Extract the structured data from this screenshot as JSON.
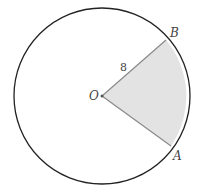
{
  "diagram": {
    "type": "circle-sector",
    "center_label": "O",
    "point_b_label": "B",
    "point_a_label": "A",
    "radius_label": "8",
    "colors": {
      "circle_stroke": "#222222",
      "radius_stroke": "#8a8a8a",
      "sector_fill": "#e3e3e3",
      "label": "#444444"
    }
  }
}
